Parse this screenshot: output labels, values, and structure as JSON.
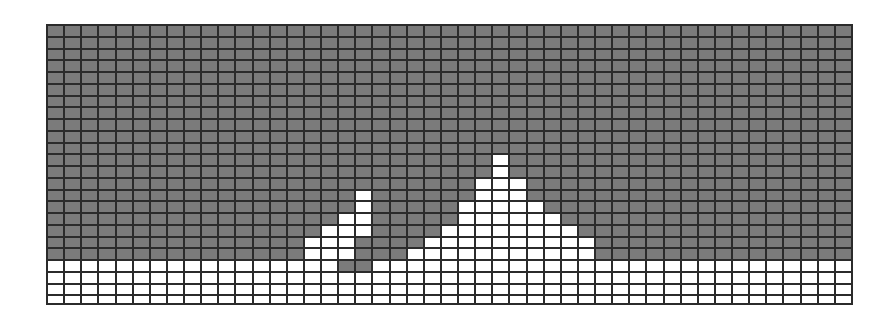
{
  "figure": {
    "colors": {
      "filled": "#7b7b7b",
      "empty": "#ffffff",
      "gridline": "#2b2b2b"
    },
    "grid": {
      "columns": 47,
      "rows": 24,
      "row_heights_px": [
        12,
        12,
        12,
        12,
        12,
        12,
        12,
        12,
        12,
        12,
        12,
        12,
        12,
        12,
        12,
        12,
        12,
        12,
        12,
        12,
        12,
        12,
        12,
        8
      ],
      "white_runs": [
        {
          "row": 11,
          "ranges": [
            [
              26,
              26
            ]
          ]
        },
        {
          "row": 12,
          "ranges": [
            [
              26,
              26
            ]
          ]
        },
        {
          "row": 13,
          "ranges": [
            [
              25,
              27
            ]
          ]
        },
        {
          "row": 14,
          "ranges": [
            [
              18,
              18
            ],
            [
              25,
              27
            ]
          ]
        },
        {
          "row": 15,
          "ranges": [
            [
              18,
              18
            ],
            [
              24,
              28
            ]
          ]
        },
        {
          "row": 16,
          "ranges": [
            [
              17,
              18
            ],
            [
              24,
              29
            ]
          ]
        },
        {
          "row": 17,
          "ranges": [
            [
              16,
              18
            ],
            [
              23,
              30
            ]
          ]
        },
        {
          "row": 18,
          "ranges": [
            [
              15,
              17
            ],
            [
              22,
              31
            ]
          ]
        },
        {
          "row": 19,
          "ranges": [
            [
              15,
              17
            ],
            [
              21,
              31
            ]
          ]
        },
        {
          "row": 20,
          "ranges": [
            [
              0,
              16
            ],
            [
              19,
              46
            ]
          ]
        },
        {
          "row": 21,
          "ranges": [
            [
              0,
              46
            ]
          ]
        },
        {
          "row": 22,
          "ranges": [
            [
              0,
              46
            ]
          ]
        },
        {
          "row": 23,
          "ranges": [
            [
              0,
              46
            ]
          ]
        }
      ]
    }
  }
}
